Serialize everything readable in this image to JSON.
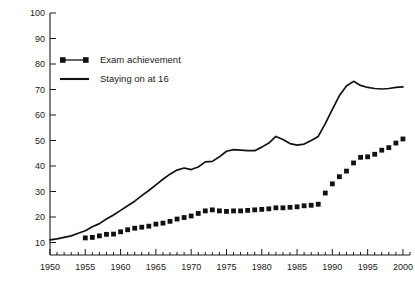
{
  "chart_data": {
    "type": "line",
    "title": "",
    "xlabel": "",
    "ylabel": "",
    "xlim": [
      1950,
      2001
    ],
    "ylim": [
      0,
      100
    ],
    "grid": false,
    "legend_position": "top-left",
    "y_ticks": [
      10,
      20,
      30,
      40,
      50,
      60,
      70,
      80,
      90,
      100
    ],
    "y_tick_labels": [
      "10",
      "20",
      "30",
      "40",
      "50",
      "60",
      "70",
      "80",
      "90",
      "100"
    ],
    "x_ticks": [
      1950,
      1955,
      1960,
      1965,
      1970,
      1975,
      1980,
      1985,
      1990,
      1995,
      2000
    ],
    "x_tick_labels": [
      "1950",
      "1955",
      "1960",
      "1965",
      "1970",
      "1975",
      "1980",
      "1985",
      "1990",
      "1995",
      "2000"
    ],
    "x_minor_tick_step": 1,
    "series": [
      {
        "name": "Exam achievement",
        "marker": "square",
        "style": "markers",
        "color": "#111111",
        "x": [
          1955,
          1956,
          1957,
          1958,
          1959,
          1960,
          1961,
          1962,
          1963,
          1964,
          1965,
          1966,
          1967,
          1968,
          1969,
          1970,
          1971,
          1972,
          1973,
          1974,
          1975,
          1976,
          1977,
          1978,
          1979,
          1980,
          1981,
          1982,
          1983,
          1984,
          1985,
          1986,
          1987,
          1988,
          1989,
          1990,
          1991,
          1992,
          1993,
          1994,
          1995,
          1996,
          1997,
          1998,
          1999,
          2000
        ],
        "values": [
          11.8,
          12.0,
          12.6,
          13.2,
          13.3,
          14.2,
          15.0,
          15.6,
          16.0,
          16.4,
          17.2,
          17.6,
          18.3,
          19.2,
          19.8,
          20.4,
          21.4,
          22.4,
          22.8,
          22.4,
          22.2,
          22.4,
          22.4,
          22.6,
          22.8,
          23.0,
          23.2,
          23.6,
          23.6,
          23.8,
          24.0,
          24.4,
          24.6,
          25.0,
          29.4,
          33.0,
          35.8,
          38.0,
          41.2,
          43.4,
          43.6,
          44.6,
          46.2,
          47.2,
          49.0,
          50.6
        ]
      },
      {
        "name": "Staying on at 16",
        "marker": "none",
        "style": "line",
        "color": "#111111",
        "x": [
          1950,
          1951,
          1952,
          1953,
          1954,
          1955,
          1956,
          1957,
          1958,
          1959,
          1960,
          1961,
          1962,
          1963,
          1964,
          1965,
          1966,
          1967,
          1968,
          1969,
          1970,
          1971,
          1972,
          1973,
          1974,
          1975,
          1976,
          1977,
          1978,
          1979,
          1980,
          1981,
          1982,
          1983,
          1984,
          1985,
          1986,
          1987,
          1988,
          1989,
          1990,
          1991,
          1992,
          1993,
          1994,
          1995,
          1996,
          1997,
          1998,
          1999,
          2000
        ],
        "values": [
          11.0,
          11.4,
          12.0,
          12.6,
          13.6,
          14.6,
          16.2,
          17.4,
          19.2,
          20.8,
          22.6,
          24.4,
          26.2,
          28.4,
          30.4,
          32.6,
          34.8,
          36.8,
          38.4,
          39.2,
          38.6,
          39.6,
          41.6,
          41.8,
          43.6,
          45.8,
          46.4,
          46.2,
          46.0,
          46.0,
          47.4,
          49.0,
          51.6,
          50.4,
          48.8,
          48.2,
          48.6,
          50.0,
          51.6,
          56.6,
          62.2,
          67.6,
          71.4,
          73.2,
          71.6,
          70.8,
          70.4,
          70.2,
          70.4,
          70.8,
          71.0
        ]
      }
    ]
  },
  "legend": {
    "items": [
      {
        "label": "Exam achievement",
        "marker": "square-line"
      },
      {
        "label": "Staying on at 16",
        "marker": "line"
      }
    ]
  }
}
